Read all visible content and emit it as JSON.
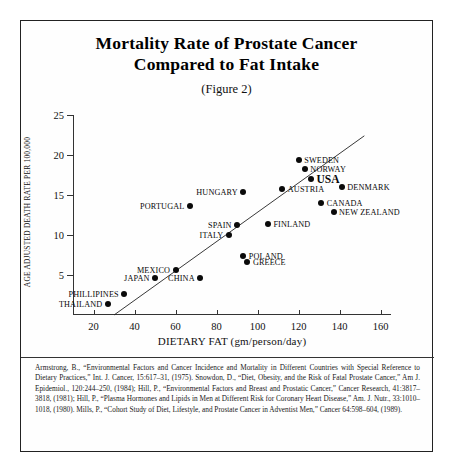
{
  "title": {
    "line1": "Mortality Rate of Prostate Cancer",
    "line2": "Compared to Fat Intake",
    "figure": "(Figure 2)"
  },
  "footnote": "Armstrong, B., “Environmental Factors and Cancer Incidence and Mortality in Different Countries with Special Reference to Dietary Practices,” Int. J. Cancer, 15:617–31, (1975). Snowdon, D., “Diet, Obesity, and the Risk of Fatal Prostate Cancer,” Am J. Epidemiol., 120:244–250, (1984); Hill, P., “Environmental Factors and Breast and Prostatic Cancer,” Cancer Research, 41:3817–3818, (1981); Hill, P., “Plasma Hormones and Lipids in Men at Different Risk for Coronary Heart Disease,” Am. J. Nutr., 33:1010–1018, (1980). Mills, P., “Cohort Study of Diet, Lifestyle, and Prostate Cancer in Adventist Men,” Cancer 64:598–604, (1989).",
  "chart_data": {
    "type": "scatter",
    "title": "Mortality Rate of Prostate Cancer Compared to Fat Intake",
    "subtitle": "(Figure 2)",
    "xlabel": "DIETARY FAT (gm/person/day)",
    "ylabel": "AGE ADJUSTED DEATH RATE PER 100,000",
    "xlim": [
      10,
      165
    ],
    "ylim": [
      0,
      25
    ],
    "xticks": [
      20,
      40,
      60,
      80,
      100,
      120,
      140,
      160
    ],
    "yticks": [
      5,
      10,
      15,
      20,
      25
    ],
    "grid": false,
    "legend": false,
    "trendline": {
      "x1": 30,
      "y1": 0,
      "x2": 152,
      "y2": 22.4
    },
    "points": [
      {
        "label": "THAILAND",
        "x": 27,
        "y": 1.4,
        "side": "left"
      },
      {
        "label": "PHILLIPINES",
        "x": 35,
        "y": 2.6,
        "side": "left"
      },
      {
        "label": "JAPAN",
        "x": 50,
        "y": 4.6,
        "side": "left"
      },
      {
        "label": "MEXICO",
        "x": 60,
        "y": 5.6,
        "side": "left"
      },
      {
        "label": "CHINA",
        "x": 72,
        "y": 4.6,
        "side": "left"
      },
      {
        "label": "PORTUGAL",
        "x": 67,
        "y": 13.6,
        "side": "left"
      },
      {
        "label": "ITALY",
        "x": 86,
        "y": 10.0,
        "side": "left"
      },
      {
        "label": "SPAIN",
        "x": 90,
        "y": 11.3,
        "side": "left"
      },
      {
        "label": "HUNGARY",
        "x": 93,
        "y": 15.4,
        "side": "left"
      },
      {
        "label": "POLAND",
        "x": 93,
        "y": 7.4,
        "side": "right"
      },
      {
        "label": "GREECE",
        "x": 95,
        "y": 6.6,
        "side": "right"
      },
      {
        "label": "FINLAND",
        "x": 105,
        "y": 11.4,
        "side": "right"
      },
      {
        "label": "AUSTRIA",
        "x": 112,
        "y": 15.8,
        "side": "right"
      },
      {
        "label": "SWEDEN",
        "x": 120,
        "y": 19.4,
        "side": "right"
      },
      {
        "label": "USA",
        "x": 126,
        "y": 17.0,
        "side": "right"
      },
      {
        "label": "NORWAY",
        "x": 123,
        "y": 18.2,
        "side": "right"
      },
      {
        "label": "CANADA",
        "x": 131,
        "y": 14.0,
        "side": "right"
      },
      {
        "label": "DENMARK",
        "x": 141,
        "y": 16.0,
        "side": "right"
      },
      {
        "label": "NEW ZEALAND",
        "x": 137,
        "y": 12.9,
        "side": "right"
      }
    ]
  }
}
